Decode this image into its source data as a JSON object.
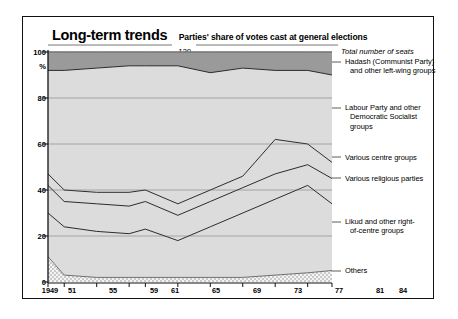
{
  "header": {
    "title": "Long-term trends",
    "subtitle": "Parties' share of votes cast at general elections"
  },
  "annotations": {
    "total_seats_label": "Total number of seats",
    "total_seats_value": "120"
  },
  "axes": {
    "y_unit": "%",
    "y_ticks": [
      "100",
      "80",
      "60",
      "40",
      "20",
      "0"
    ],
    "x_ticks": [
      "1949",
      "51",
      "55",
      "59",
      "61",
      "65",
      "69",
      "73",
      "77",
      "81",
      "84"
    ]
  },
  "series_labels": [
    {
      "id": "hadash",
      "text_lines": [
        "Hadash (Communist Party)",
        "and other left-wing groups"
      ]
    },
    {
      "id": "labour",
      "text_lines": [
        "Labour Party and other",
        "Democratic Socialist",
        "groups"
      ]
    },
    {
      "id": "centre",
      "text_lines": [
        "Various centre groups"
      ]
    },
    {
      "id": "religious",
      "text_lines": [
        "Various religious parties"
      ]
    },
    {
      "id": "likud",
      "text_lines": [
        "Likud and other right-",
        "of-centre groups"
      ]
    },
    {
      "id": "others",
      "text_lines": [
        "Others"
      ]
    }
  ],
  "colors": {
    "band_dark": "#9a9a9a",
    "band_light": "#dcdcdc",
    "band_others": "#ececec",
    "line": "#2b2b2b",
    "frame": "#111111",
    "gridline": "#555555"
  },
  "chart_data": {
    "type": "area",
    "title": "Long-term trends",
    "subtitle": "Parties' share of votes cast at general elections",
    "xlabel": "",
    "ylabel": "%",
    "ylim": [
      0,
      100
    ],
    "grid": true,
    "legend_position": "right",
    "stacked": true,
    "stack_order_bottom_to_top": [
      "Others",
      "Likud and other right-of-centre groups",
      "Various religious parties",
      "Various centre groups",
      "Labour Party and other Democratic Socialist groups",
      "Hadash (Communist Party) and other left-wing groups"
    ],
    "x": [
      "1949",
      "51",
      "55",
      "59",
      "61",
      "65",
      "69",
      "73",
      "77",
      "81",
      "84"
    ],
    "series": [
      {
        "name": "Others",
        "values": [
          11,
          3,
          2,
          2,
          2,
          2,
          2,
          2,
          3,
          4,
          5
        ]
      },
      {
        "name": "Likud and other right-of-centre groups",
        "values": [
          19,
          21,
          20,
          19,
          21,
          16,
          22,
          28,
          33,
          38,
          29
        ]
      },
      {
        "name": "Various religious parties",
        "values": [
          12,
          11,
          12,
          12,
          12,
          11,
          11,
          11,
          11,
          9,
          11
        ]
      },
      {
        "name": "Various centre groups",
        "values": [
          5,
          5,
          5,
          6,
          5,
          5,
          5,
          5,
          15,
          9,
          7
        ]
      },
      {
        "name": "Labour Party and other Democratic Socialist groups",
        "values": [
          45,
          52,
          54,
          55,
          54,
          60,
          51,
          47,
          30,
          32,
          38
        ]
      },
      {
        "name": "Hadash (Communist Party) and other left-wing groups",
        "values": [
          8,
          8,
          7,
          6,
          6,
          6,
          9,
          7,
          8,
          8,
          10
        ]
      }
    ],
    "cumulative_top_boundaries": {
      "note": "Stacked cumulative upper edge of each band, bottom to top, in percent",
      "others": [
        11,
        3,
        2,
        2,
        2,
        2,
        2,
        2,
        3,
        4,
        5
      ],
      "likud": [
        30,
        24,
        22,
        21,
        23,
        18,
        24,
        30,
        36,
        42,
        34
      ],
      "religious": [
        42,
        35,
        34,
        33,
        35,
        29,
        35,
        41,
        47,
        51,
        45
      ],
      "centre": [
        47,
        40,
        39,
        39,
        40,
        34,
        40,
        46,
        62,
        60,
        52
      ],
      "labour": [
        92,
        92,
        93,
        94,
        94,
        94,
        91,
        93,
        92,
        92,
        90
      ],
      "hadash": [
        100,
        100,
        100,
        100,
        100,
        100,
        100,
        100,
        100,
        100,
        100
      ]
    }
  }
}
